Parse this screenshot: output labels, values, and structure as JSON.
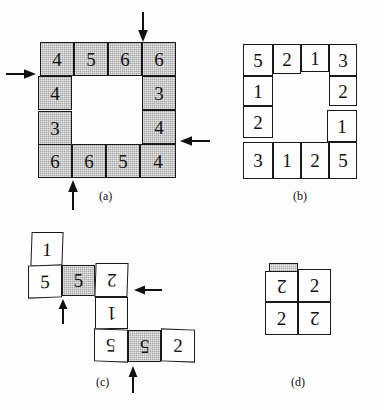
{
  "figure": {
    "background_color": "#fdfdfd",
    "line_color": "#1a1a1a",
    "shaded_color": "#a9a9a9",
    "panels": [
      {
        "id": "a",
        "caption": "(a)",
        "description": "4x4 ring of shaded numbered square tiles with four directional arrows",
        "all_shaded": true,
        "ring_values_clockwise_from_top_left": [
          4,
          5,
          6,
          6,
          3,
          4,
          4,
          5,
          6,
          6,
          3,
          4
        ],
        "rows": [
          [
            "4",
            "5",
            "6",
            "6"
          ],
          [
            "4",
            "",
            "",
            "3"
          ],
          [
            "3",
            "",
            "",
            "4"
          ],
          [
            "6",
            "6",
            "5",
            "4"
          ]
        ],
        "arrows": [
          {
            "name": "arrow-top-down",
            "direction": "down"
          },
          {
            "name": "arrow-left-right",
            "direction": "right"
          },
          {
            "name": "arrow-right-left",
            "direction": "left"
          },
          {
            "name": "arrow-bottom-up",
            "direction": "up"
          }
        ]
      },
      {
        "id": "b",
        "caption": "(b)",
        "description": "4x4 ring of unshaded numbered square tiles",
        "all_shaded": false,
        "rows": [
          [
            "5",
            "2",
            "1",
            "3"
          ],
          [
            "1",
            "",
            "",
            "2"
          ],
          [
            "2",
            "",
            "",
            "1"
          ],
          [
            "3",
            "1",
            "2",
            "5"
          ]
        ]
      },
      {
        "id": "c",
        "caption": "(c)",
        "description": "Unfolded staircase strip of tiles, several rotated 180 degrees, two tiles shaded, three arrows",
        "tiles": [
          {
            "name": "tile-c-1",
            "value": "1",
            "shaded": false,
            "flipped": false
          },
          {
            "name": "tile-c-5a",
            "value": "5",
            "shaded": false,
            "flipped": false
          },
          {
            "name": "tile-c-5b",
            "value": "5",
            "shaded": true,
            "flipped": false
          },
          {
            "name": "tile-c-2a",
            "value": "2",
            "shaded": false,
            "flipped": true
          },
          {
            "name": "tile-c-1b",
            "value": "1",
            "shaded": false,
            "flipped": true
          },
          {
            "name": "tile-c-5c",
            "value": "5",
            "shaded": false,
            "flipped": true
          },
          {
            "name": "tile-c-5d",
            "value": "5",
            "shaded": true,
            "flipped": true
          },
          {
            "name": "tile-c-2b",
            "value": "2",
            "shaded": false,
            "flipped": false
          }
        ],
        "arrows": [
          {
            "name": "arrow-c-left-up",
            "direction": "up"
          },
          {
            "name": "arrow-c-right-left",
            "direction": "left"
          },
          {
            "name": "arrow-c-bottom-up",
            "direction": "up"
          }
        ]
      },
      {
        "id": "d",
        "caption": "(d)",
        "description": "2x2 block of tiles all valued 2 with alternating 180 degree rotation, small shaded tab at top-left",
        "rows": [
          [
            {
              "value": "2",
              "flipped": true
            },
            {
              "value": "2",
              "flipped": false
            }
          ],
          [
            {
              "value": "2",
              "flipped": false
            },
            {
              "value": "2",
              "flipped": true
            }
          ]
        ],
        "tab": {
          "name": "shaded-tab",
          "shaded": true
        }
      }
    ]
  }
}
